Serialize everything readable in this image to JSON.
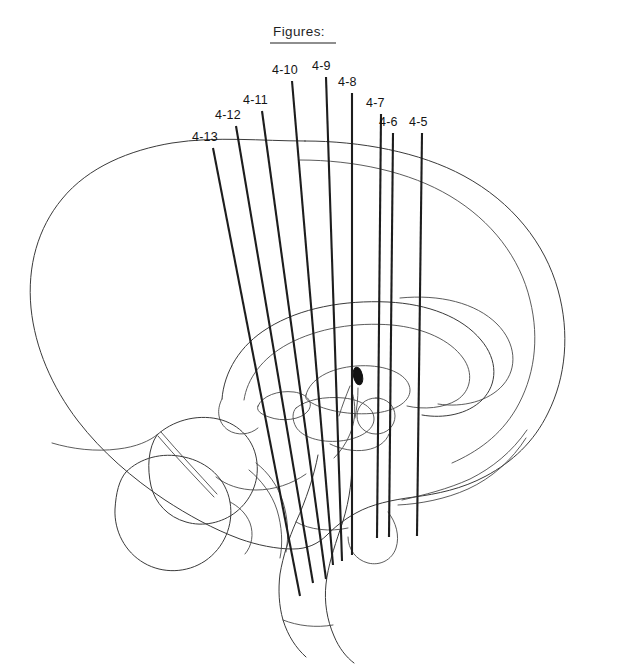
{
  "figure": {
    "title": "Figures:",
    "title_underlined": true,
    "kind": "sagittal-brain-schematic-with-electrode-trajectories",
    "background_color": "#ffffff",
    "ink_color": "#1d1d1d",
    "outline_color": "#3a3a3a",
    "marker_color": "#121212"
  },
  "labels": [
    {
      "id": "4-13",
      "text": "4-13",
      "x": 192,
      "y": 141,
      "line": {
        "x1": 213,
        "y1": 148,
        "x2": 300,
        "y2": 596
      }
    },
    {
      "id": "4-12",
      "text": "4-12",
      "x": 215,
      "y": 119,
      "line": {
        "x1": 236,
        "y1": 126,
        "x2": 313,
        "y2": 583
      }
    },
    {
      "id": "4-11",
      "text": "4-11",
      "x": 243,
      "y": 104,
      "line": {
        "x1": 262,
        "y1": 111,
        "x2": 326,
        "y2": 579
      }
    },
    {
      "id": "4-10",
      "text": "4-10",
      "x": 272,
      "y": 74,
      "line": {
        "x1": 292,
        "y1": 81,
        "x2": 333,
        "y2": 565
      }
    },
    {
      "id": "4-9",
      "text": "4-9",
      "x": 312,
      "y": 70,
      "line": {
        "x1": 326,
        "y1": 77,
        "x2": 342,
        "y2": 561
      }
    },
    {
      "id": "4-8",
      "text": "4-8",
      "x": 338,
      "y": 86,
      "line": {
        "x1": 352,
        "y1": 93,
        "x2": 352,
        "y2": 555
      }
    },
    {
      "id": "4-7",
      "text": "4-7",
      "x": 366,
      "y": 107,
      "line": {
        "x1": 381,
        "y1": 114,
        "x2": 377,
        "y2": 538
      }
    },
    {
      "id": "4-6",
      "text": "4-6",
      "x": 379,
      "y": 126,
      "line": {
        "x1": 393,
        "y1": 133,
        "x2": 389,
        "y2": 537
      }
    },
    {
      "id": "4-5",
      "text": "4-5",
      "x": 409,
      "y": 126,
      "line": {
        "x1": 422,
        "y1": 133,
        "x2": 417,
        "y2": 536
      }
    }
  ],
  "title_position": {
    "x": 273,
    "y": 36,
    "rule_x1": 270,
    "rule_x2": 336,
    "rule_y": 43
  },
  "marker": {
    "name": "pineal-marker",
    "cx": 358,
    "cy": 376,
    "rx": 4.5,
    "ry": 9,
    "rotation": -12
  }
}
